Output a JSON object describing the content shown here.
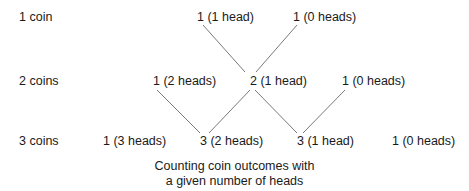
{
  "rows": [
    {
      "label": "1 coin",
      "nodes": [
        "1 (1 head)",
        "1 (0 heads)"
      ]
    },
    {
      "label": "2 coins",
      "nodes": [
        "1 (2 heads)",
        "2 (1 head)",
        "1 (0 heads)"
      ]
    },
    {
      "label": "3 coins",
      "nodes": [
        "1 (3 heads)",
        "3 (2 heads)",
        "3 (1 head)",
        "1 (0 heads)"
      ]
    }
  ],
  "caption": {
    "line1": "Counting coin outcomes with",
    "line2": "a given number of heads"
  },
  "colors": {
    "text": "#1a1a1a",
    "edge": "#6a6a6a",
    "background": "#ffffff"
  }
}
